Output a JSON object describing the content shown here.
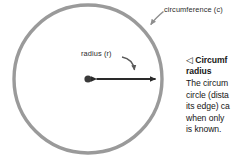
{
  "figure": {
    "type": "geometry-diagram",
    "subject": "circle",
    "circle": {
      "stroke_color": "#9a9a9a",
      "stroke_width": 3.4,
      "center_x": 88,
      "center_y": 79,
      "radius": 74
    },
    "center_dot": {
      "color": "#3a3a3a",
      "radius": 3.6
    },
    "radius_arrow": {
      "color": "#2a2a2a",
      "from_x": 95,
      "to_x": 163,
      "y": 79,
      "double_headed": true
    },
    "labels": {
      "circumference": "circumference (c)",
      "radius": "radius (r)"
    },
    "leader_colors": {
      "circumference_leader": "#8e8e8e",
      "radius_leader": "#5a5a5a"
    }
  },
  "caption": {
    "marker": "◁",
    "heading_line_1": "Circumf",
    "heading_line_2": "radius",
    "body_lines": [
      "The circum",
      "circle (dista",
      "its edge) ca",
      "when only",
      "is known."
    ]
  }
}
